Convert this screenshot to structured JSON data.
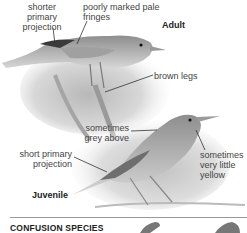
{
  "figure": {
    "adult": {
      "tag": "Adult",
      "callouts": [
        {
          "id": "shorter-primary-projection",
          "text": "shorter\nprimary\nprojection"
        },
        {
          "id": "poorly-marked-pale-fringes",
          "text": "poorly marked pale\nfringes"
        },
        {
          "id": "brown-legs",
          "text": "brown legs"
        }
      ]
    },
    "juvenile": {
      "tag": "Juvenile",
      "callouts": [
        {
          "id": "sometimes-grey-above",
          "text": "sometimes\ngrey above"
        },
        {
          "id": "short-primary-projection",
          "text": "short primary\nprojection"
        },
        {
          "id": "sometimes-very-little-yellow",
          "text": "sometimes\nvery little\nyellow"
        }
      ]
    }
  },
  "section": {
    "title": "CONFUSION SPECIES"
  },
  "colors": {
    "text": "#444444",
    "heading": "#222222",
    "divider": "#999999"
  }
}
